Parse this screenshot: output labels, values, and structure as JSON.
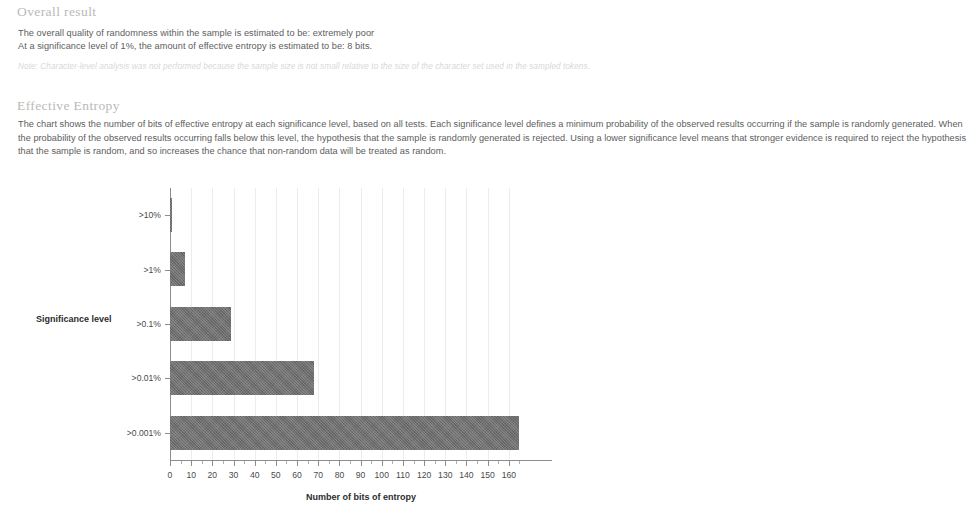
{
  "document": {
    "sections": [
      {
        "id": "overall",
        "heading": "Overall result",
        "lines": [
          "The overall quality of randomness within the sample is estimated to be: extremely poor",
          "At a significance level of 1%, the amount of effective entropy is estimated to be: 8 bits."
        ],
        "note": "Note: Character-level analysis was not performed because the sample size is not small relative to the size of the character set used in the sampled tokens."
      },
      {
        "id": "effective-entropy",
        "heading": "Effective Entropy",
        "paragraph": "The chart shows the number of bits of effective entropy at each significance level, based on all tests. Each significance level defines a minimum probability of the observed results occurring if the sample is randomly generated. When the probability of the observed results occurring falls below this level, the hypothesis that the sample is randomly generated is rejected. Using a lower significance level means that stronger evidence is required to reject the hypothesis that the sample is random, and so increases the chance that non-random data will be treated as random."
      }
    ]
  },
  "chart_data": {
    "type": "bar",
    "orientation": "horizontal",
    "title": "",
    "xlabel": "Number of bits of entropy",
    "ylabel": "Significance level",
    "categories": [
      ">10%",
      ">1%",
      ">0.1%",
      ">0.01%",
      ">0.001%"
    ],
    "values": [
      1,
      7,
      29,
      68,
      165
    ],
    "xlim": [
      0,
      170
    ],
    "xticks": [
      0,
      10,
      20,
      30,
      40,
      50,
      60,
      70,
      80,
      90,
      100,
      110,
      120,
      130,
      140,
      150,
      160
    ],
    "grid": true,
    "legend": false,
    "bar_color": "#6f6f6f",
    "axis_color": "#8d8d8d",
    "grid_color": "#ececec"
  }
}
